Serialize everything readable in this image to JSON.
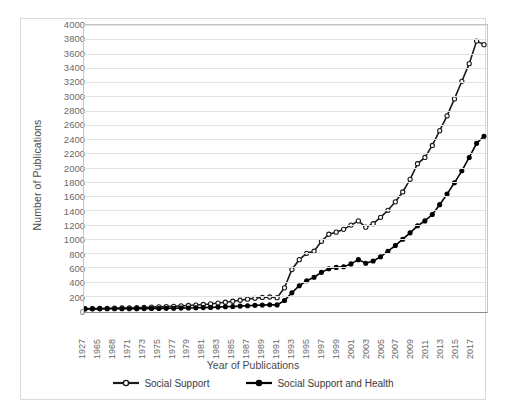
{
  "chart_data": {
    "type": "line",
    "title": "",
    "xlabel": "Year of Publications",
    "ylabel": "Number of Publications",
    "ylim": [
      0,
      4000
    ],
    "ytick_step": 200,
    "grid": true,
    "legend_position": "bottom",
    "ytick_labels": [
      "0",
      "200",
      "400",
      "600",
      "800",
      "1000",
      "1200",
      "1400",
      "1600",
      "1800",
      "2000",
      "2200",
      "2400",
      "2600",
      "2800",
      "3000",
      "3200",
      "3400",
      "3600",
      "3800",
      "4000"
    ],
    "xtick_labels": [
      "1927",
      "1965",
      "1968",
      "1971",
      "1973",
      "1975",
      "1977",
      "1979",
      "1981",
      "1983",
      "1985",
      "1987",
      "1989",
      "1991",
      "1993",
      "1995",
      "1997",
      "1999",
      "2001",
      "2003",
      "2005",
      "2007",
      "2009",
      "2011",
      "2013",
      "2015",
      "2017"
    ],
    "x": [
      1927,
      1964,
      1965,
      1966,
      1967,
      1968,
      1969,
      1970,
      1971,
      1972,
      1973,
      1974,
      1975,
      1976,
      1977,
      1978,
      1979,
      1980,
      1981,
      1982,
      1983,
      1984,
      1985,
      1986,
      1987,
      1988,
      1989,
      1990,
      1991,
      1992,
      1993,
      1994,
      1995,
      1996,
      1997,
      1998,
      1999,
      2000,
      2001,
      2002,
      2003,
      2004,
      2005,
      2006,
      2007,
      2008,
      2009,
      2010,
      2011,
      2012,
      2013,
      2014,
      2015,
      2016,
      2017
    ],
    "series": [
      {
        "name": "Social Support",
        "marker": "open-circle",
        "color": "#1a1a1a",
        "values": [
          4,
          6,
          8,
          10,
          12,
          14,
          16,
          18,
          22,
          26,
          30,
          34,
          38,
          44,
          50,
          56,
          64,
          72,
          84,
          96,
          110,
          124,
          140,
          152,
          164,
          170,
          160,
          300,
          560,
          700,
          790,
          820,
          960,
          1060,
          1090,
          1130,
          1190,
          1250,
          1160,
          1210,
          1300,
          1400,
          1520,
          1660,
          1840,
          2060,
          2150,
          2320,
          2530,
          2740,
          2980,
          3230,
          3480,
          3800,
          3750
        ]
      },
      {
        "name": "Social Support and Health",
        "marker": "filled-circle",
        "color": "#000000",
        "values": [
          1,
          2,
          2,
          3,
          3,
          4,
          4,
          5,
          6,
          7,
          8,
          9,
          11,
          13,
          15,
          17,
          20,
          23,
          27,
          31,
          36,
          41,
          47,
          52,
          57,
          60,
          58,
          120,
          230,
          330,
          400,
          450,
          520,
          570,
          590,
          600,
          640,
          700,
          650,
          680,
          740,
          820,
          900,
          990,
          1080,
          1180,
          1250,
          1340,
          1480,
          1630,
          1790,
          1960,
          2150,
          2350,
          2450
        ]
      }
    ]
  }
}
